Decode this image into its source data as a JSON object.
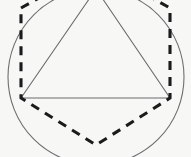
{
  "figure": {
    "background_color": "#f7f7f5",
    "canvas": {
      "width": 191,
      "height": 157
    }
  },
  "chart_data": {
    "type": "diagram",
    "xlabel": "",
    "ylabel": "",
    "grid": false,
    "legend": "none",
    "xlim": [
      0,
      191
    ],
    "ylim": [
      0,
      157
    ],
    "shapes": [
      {
        "name": "circumscribed-circle",
        "type": "circle",
        "center": [
          96,
          77
        ],
        "radius": 88,
        "stroke": "#6e6e72",
        "stroke_width": 1.1,
        "style": "solid",
        "fill": "none"
      },
      {
        "name": "inscribed-triangle",
        "type": "polygon",
        "sides": 3,
        "points": [
          [
            96,
            -11
          ],
          [
            170,
            98
          ],
          [
            21,
            98
          ]
        ],
        "stroke": "#6a6a6e",
        "stroke_width": 1.05,
        "style": "solid",
        "fill": "none"
      },
      {
        "name": "dashed-hexagon",
        "type": "polygon",
        "sides": 6,
        "points": [
          [
            21,
            8
          ],
          [
            96,
            -34
          ],
          [
            170,
            8
          ],
          [
            170,
            98
          ],
          [
            96,
            145
          ],
          [
            21,
            98
          ]
        ],
        "stroke": "#1b1b1b",
        "stroke_width": 3.1,
        "style": "dashed",
        "dash_pattern": "9 7",
        "fill": "none"
      }
    ],
    "vertices": [
      {
        "label": "triangle-apex",
        "x": 96,
        "y": -11,
        "visible": false
      },
      {
        "label": "triangle-left-base",
        "x": 21,
        "y": 98,
        "visible": true
      },
      {
        "label": "triangle-right-base",
        "x": 170,
        "y": 98,
        "visible": true
      },
      {
        "label": "hexagon-upper-left",
        "x": 21,
        "y": 8,
        "visible": true
      },
      {
        "label": "hexagon-top",
        "x": 96,
        "y": -34,
        "visible": false
      },
      {
        "label": "hexagon-upper-right",
        "x": 170,
        "y": 8,
        "visible": true
      },
      {
        "label": "hexagon-lower-right",
        "x": 170,
        "y": 98,
        "visible": true
      },
      {
        "label": "hexagon-bottom",
        "x": 96,
        "y": 145,
        "visible": true
      },
      {
        "label": "hexagon-lower-left",
        "x": 21,
        "y": 98,
        "visible": true
      }
    ]
  }
}
